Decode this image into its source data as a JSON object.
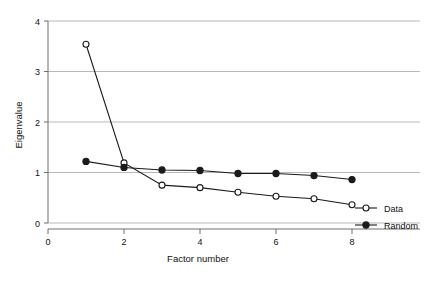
{
  "chart_data": {
    "type": "line",
    "title": "",
    "xlabel": "Factor number",
    "ylabel": "Eigenvalue",
    "x": [
      1,
      2,
      3,
      4,
      5,
      6,
      7,
      8
    ],
    "xlim": [
      0,
      8.6
    ],
    "ylim": [
      0,
      4.1
    ],
    "xticks": [
      0,
      2,
      4,
      6,
      8
    ],
    "xticklabels": [
      "0",
      "2",
      "4",
      "6",
      "8"
    ],
    "yticks": [
      0,
      1,
      2,
      3,
      4
    ],
    "yticklabels": [
      "0",
      "1",
      "2",
      "3",
      "4"
    ],
    "grid": "horizontal",
    "grid_color": "#b9b9b9",
    "legend_position": "right",
    "series": [
      {
        "name": "Data",
        "marker": "open-circle",
        "color": "#1a1a1a",
        "values": [
          3.54,
          1.19,
          0.75,
          0.7,
          0.61,
          0.53,
          0.48,
          0.36
        ]
      },
      {
        "name": "Random",
        "marker": "filled-circle",
        "color": "#1a1a1a",
        "values": [
          1.22,
          1.1,
          1.05,
          1.04,
          0.98,
          0.98,
          0.94,
          0.86
        ]
      }
    ]
  },
  "axes": {
    "x_title": "Factor number",
    "y_title": "Eigenvalue"
  },
  "legend": {
    "items": [
      {
        "label": "Data"
      },
      {
        "label": "Random"
      }
    ]
  }
}
